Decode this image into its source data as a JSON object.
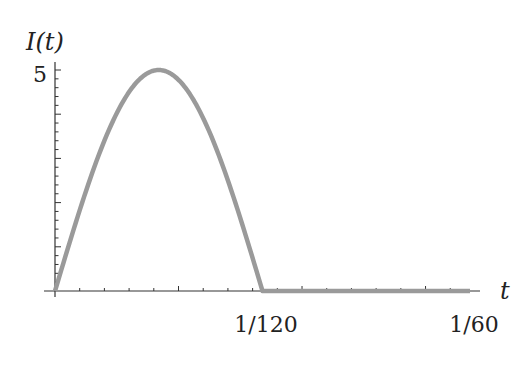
{
  "chart_data": {
    "type": "line",
    "title": "",
    "xlabel": "t",
    "ylabel": "I(t)",
    "xlim": [
      0,
      0.0166667
    ],
    "ylim": [
      0,
      5
    ],
    "x_tick_labels": [
      {
        "value": 0.0083333,
        "label": "1/120"
      },
      {
        "value": 0.0166667,
        "label": "1/60"
      }
    ],
    "y_tick_labels": [
      {
        "value": 5,
        "label": "5"
      }
    ],
    "grid": false,
    "legend": null,
    "series": [
      {
        "name": "I(t)",
        "description": "Half-wave rectified sine: 5*sin(120*pi*t) for 0<=t<=1/120, 0 for 1/120<t<=1/60",
        "color": "#9a9a9a",
        "x": [
          0,
          0.00104167,
          0.00208333,
          0.003125,
          0.00416667,
          0.00520833,
          0.00625,
          0.00729167,
          0.00833333,
          0.01041667,
          0.0125,
          0.01458333,
          0.01666667
        ],
        "y": [
          0,
          1.91,
          3.54,
          4.62,
          5.0,
          4.62,
          3.54,
          1.91,
          0,
          0,
          0,
          0,
          0
        ]
      }
    ]
  },
  "labels": {
    "y_axis": "I(t)",
    "x_axis": "t",
    "y_max": "5",
    "x_mid": "1/120",
    "x_end": "1/60"
  },
  "colors": {
    "curve": "#9a9a9a",
    "axis": "#333333"
  }
}
